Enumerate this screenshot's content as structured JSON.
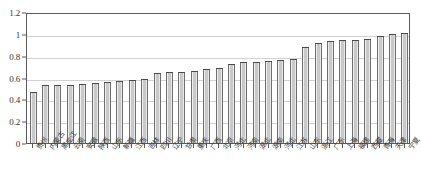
{
  "chart_data": {
    "type": "bar",
    "title": "",
    "xlabel": "",
    "ylabel": "",
    "ylim": [
      0,
      1.2
    ],
    "grid": true,
    "legend": "none",
    "ytick_labels": [
      "0",
      "0.2",
      "0.4",
      "0.6",
      "0.8",
      "1",
      "1.2"
    ],
    "ytick_values": [
      0,
      0.2,
      0.4,
      0.6,
      0.8,
      1.0,
      1.2
    ],
    "categories": [
      "贵州",
      "内蒙古",
      "黑龙江",
      "云南",
      "安徽",
      "陕西",
      "山东",
      "新疆",
      "江西",
      "吉林",
      "四川",
      "辽宁",
      "甘肃",
      "重庆",
      "广西",
      "北京",
      "河北",
      "河南",
      "湖北",
      "湖南",
      "河北",
      "江苏",
      "山东",
      "浙江",
      "广东",
      "上海",
      "福建",
      "西藏",
      "青海",
      "天津",
      "宁夏"
    ],
    "values": [
      0.47,
      0.53,
      0.53,
      0.53,
      0.54,
      0.55,
      0.56,
      0.57,
      0.58,
      0.59,
      0.64,
      0.65,
      0.65,
      0.66,
      0.68,
      0.69,
      0.72,
      0.74,
      0.74,
      0.75,
      0.76,
      0.77,
      0.88,
      0.92,
      0.93,
      0.94,
      0.94,
      0.95,
      0.98,
      1.0,
      1.01
    ],
    "colors": {
      "bar_fill": "#c9c9c9",
      "bar_edge": "#4a4a4a",
      "grid": "#d2d2d2",
      "axis": "#5a5a5a",
      "text": "#333333"
    }
  }
}
